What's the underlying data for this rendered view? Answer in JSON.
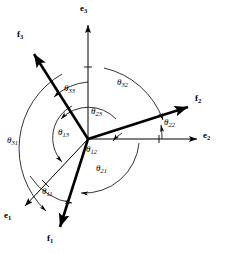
{
  "figure": {
    "name": "direction-cosine-angle-diagram",
    "background_color": "#ffffff",
    "stroke_color": "#000000",
    "origin": {
      "x": 88,
      "y": 139
    }
  },
  "vectors": [
    {
      "id": "e1",
      "label": "e",
      "sub": "1",
      "kind": "reference-axis",
      "tip": {
        "x": 22,
        "y": 208
      },
      "label_pos": {
        "x": 5,
        "y": 212
      },
      "weight": "thin"
    },
    {
      "id": "e2",
      "label": "e",
      "sub": "2",
      "kind": "reference-axis",
      "tip": {
        "x": 200,
        "y": 139
      },
      "label_pos": {
        "x": 203,
        "y": 133
      },
      "weight": "thin"
    },
    {
      "id": "e3",
      "label": "e",
      "sub": "3",
      "kind": "reference-axis",
      "tip": {
        "x": 88,
        "y": 22
      },
      "label_pos": {
        "x": 80,
        "y": 5
      },
      "weight": "thin"
    },
    {
      "id": "f1",
      "label": "f",
      "sub": "1",
      "kind": "rotated-axis",
      "tip": {
        "x": 62,
        "y": 232
      },
      "label_pos": {
        "x": 48,
        "y": 236
      },
      "weight": "thick"
    },
    {
      "id": "f2",
      "label": "f",
      "sub": "2",
      "kind": "rotated-axis",
      "tip": {
        "x": 193,
        "y": 104
      },
      "label_pos": {
        "x": 196,
        "y": 96
      },
      "weight": "thick"
    },
    {
      "id": "f3",
      "label": "f",
      "sub": "3",
      "kind": "rotated-axis",
      "tip": {
        "x": 30,
        "y": 48
      },
      "label_pos": {
        "x": 18,
        "y": 32
      },
      "weight": "thick"
    }
  ],
  "angles": [
    {
      "id": "theta11",
      "label": "θ",
      "sub": "11",
      "from": "e1",
      "to": "f1",
      "label_pos": {
        "x": 44,
        "y": 190
      }
    },
    {
      "id": "theta12",
      "label": "θ",
      "sub": "12",
      "from": "e2",
      "to": "f1",
      "label_pos": {
        "x": 88,
        "y": 148
      }
    },
    {
      "id": "theta13",
      "label": "θ",
      "sub": "13",
      "from": "e3",
      "to": "f1",
      "label_pos": {
        "x": 60,
        "y": 132
      }
    },
    {
      "id": "theta21",
      "label": "θ",
      "sub": "21",
      "from": "e1",
      "to": "f2",
      "label_pos": {
        "x": 98,
        "y": 167
      }
    },
    {
      "id": "theta22",
      "label": "θ",
      "sub": "22",
      "from": "e2",
      "to": "f2",
      "label_pos": {
        "x": 166,
        "y": 121
      }
    },
    {
      "id": "theta23",
      "label": "θ",
      "sub": "23",
      "from": "e3",
      "to": "f2",
      "label_pos": {
        "x": 92,
        "y": 110
      }
    },
    {
      "id": "theta31",
      "label": "θ",
      "sub": "31",
      "from": "e1",
      "to": "f3",
      "label_pos": {
        "x": 9,
        "y": 139
      }
    },
    {
      "id": "theta32",
      "label": "θ",
      "sub": "32",
      "from": "e2",
      "to": "f3",
      "label_pos": {
        "x": 119,
        "y": 82
      }
    },
    {
      "id": "theta33",
      "label": "θ",
      "sub": "33",
      "from": "e3",
      "to": "f3",
      "label_pos": {
        "x": 66,
        "y": 88
      }
    }
  ]
}
